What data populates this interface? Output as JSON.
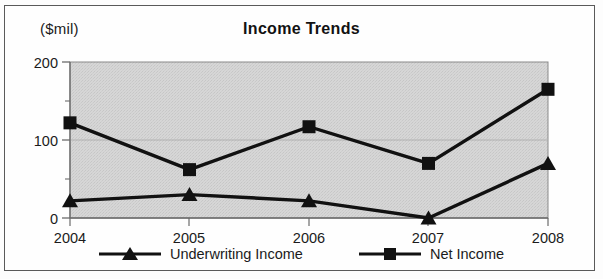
{
  "chart_data": {
    "type": "line",
    "title": "Income Trends",
    "xlabel": "",
    "ylabel": "($mil)",
    "categories": [
      "2004",
      "2005",
      "2006",
      "2007",
      "2008"
    ],
    "series": [
      {
        "name": "Underwriting Income",
        "marker": "triangle",
        "values": [
          22,
          30,
          22,
          0,
          70
        ]
      },
      {
        "name": "Net Income",
        "marker": "square",
        "values": [
          122,
          62,
          117,
          70,
          165
        ]
      }
    ],
    "ylim": [
      0,
      200
    ],
    "yticks": [
      0,
      100,
      200
    ],
    "ytick_labels": [
      "0",
      "100",
      "200"
    ],
    "yminor_ticks": [
      50,
      150
    ],
    "grid": true,
    "gridlines": [
      100
    ],
    "legend_position": "bottom",
    "plot_background": "#d4d4d4",
    "line_color": "#111111",
    "axis_color": "#6b6b6b"
  },
  "axis": {
    "unit_label": "($mil)",
    "ytick_0": "0",
    "ytick_100": "100",
    "ytick_200": "200",
    "xtick_2004": "2004",
    "xtick_2005": "2005",
    "xtick_2006": "2006",
    "xtick_2007": "2007",
    "xtick_2008": "2008"
  },
  "legend": {
    "entries": [
      {
        "label": "Underwriting Income"
      },
      {
        "label": "Net Income"
      }
    ]
  }
}
